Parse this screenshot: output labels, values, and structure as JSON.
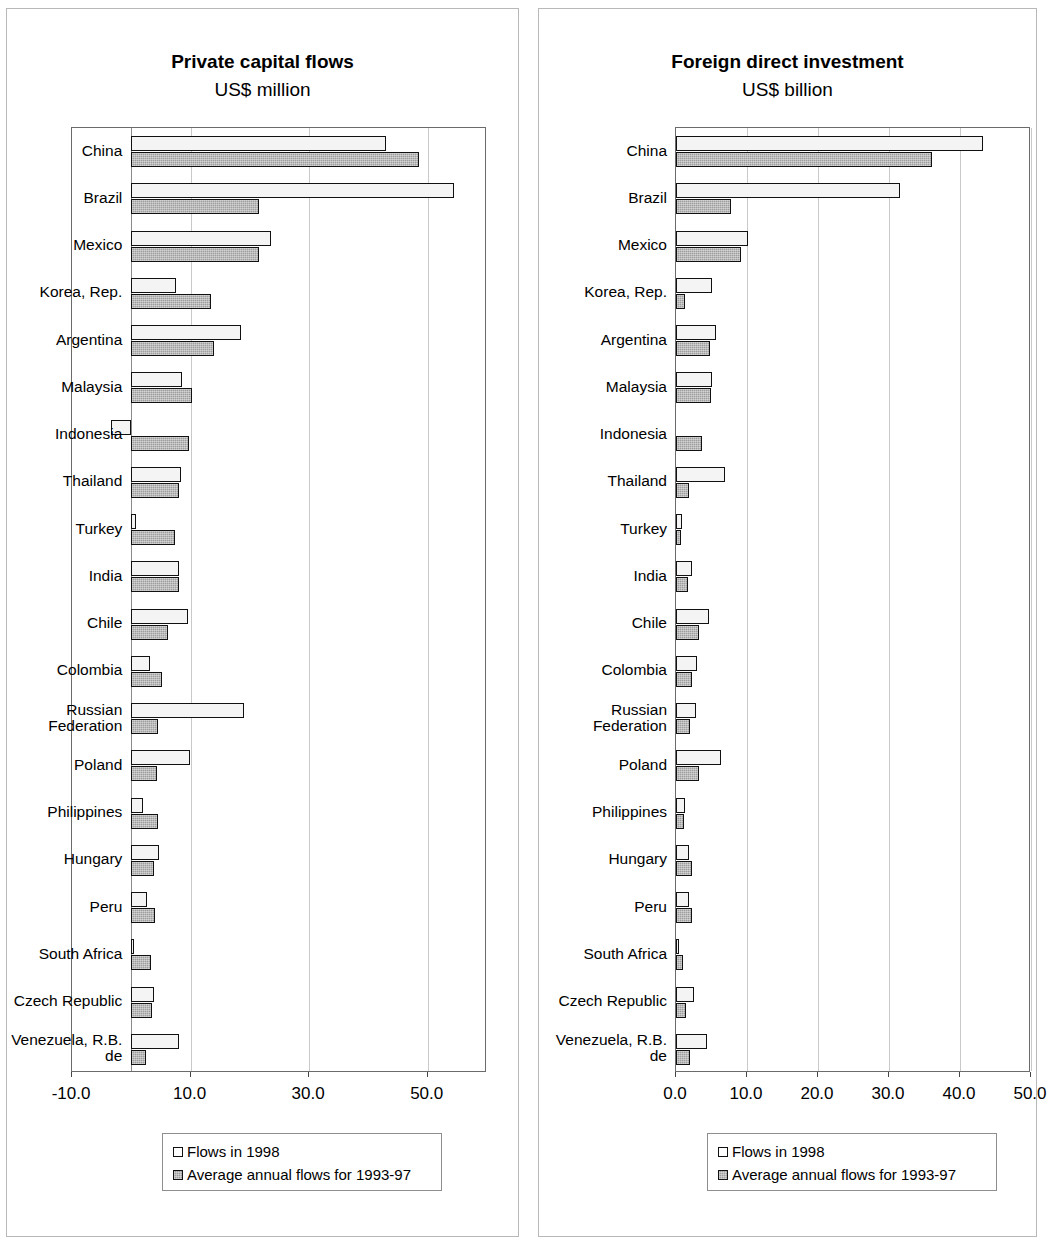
{
  "charts": [
    {
      "id": "private-capital-flows",
      "title": "Private capital flows",
      "subtitle": "US$ million",
      "legend": {
        "series1": "Flows in 1998",
        "series2": "Average annual flows for 1993-97"
      }
    },
    {
      "id": "foreign-direct-investment",
      "title": "Foreign direct investment",
      "subtitle": "US$ billion",
      "legend": {
        "series1": "Flows in 1998",
        "series2": "Average annual flows for 1993-97"
      }
    }
  ],
  "chart_data": [
    {
      "type": "bar",
      "orientation": "horizontal",
      "title": "Private capital flows",
      "subtitle": "US$ million",
      "xlabel": "",
      "ylabel": "",
      "xlim": [
        -10.0,
        60.0
      ],
      "ticks": [
        "-10.0",
        "10.0",
        "30.0",
        "50.0"
      ],
      "tick_values": [
        -10.0,
        10.0,
        30.0,
        50.0
      ],
      "grid": true,
      "legend_position": "below",
      "categories": [
        "China",
        "Brazil",
        "Mexico",
        "Korea, Rep.",
        "Argentina",
        "Malaysia",
        "Indonesia",
        "Thailand",
        "Turkey",
        "India",
        "Chile",
        "Colombia",
        "Russian\nFederation",
        "Poland",
        "Philippines",
        "Hungary",
        "Peru",
        "South Africa",
        "Czech Republic",
        "Venezuela, R.B.\nde"
      ],
      "series": [
        {
          "name": "Flows in 1998",
          "values": [
            43.0,
            54.5,
            23.5,
            7.5,
            18.5,
            8.5,
            -3.5,
            8.4,
            0.8,
            8.0,
            9.5,
            3.2,
            19.0,
            9.9,
            2.0,
            4.7,
            2.7,
            0.5,
            3.8,
            8.0
          ]
        },
        {
          "name": "Average annual flows for 1993-97",
          "values": [
            48.5,
            21.5,
            21.5,
            13.5,
            14.0,
            10.2,
            9.7,
            8.0,
            7.4,
            8.0,
            6.2,
            5.1,
            4.5,
            4.3,
            4.5,
            3.8,
            4.0,
            3.3,
            3.5,
            2.5
          ]
        }
      ]
    },
    {
      "type": "bar",
      "orientation": "horizontal",
      "title": "Foreign direct investment",
      "subtitle": "US$ billion",
      "xlabel": "",
      "ylabel": "",
      "xlim": [
        0.0,
        50.0
      ],
      "ticks": [
        "0.0",
        "10.0",
        "20.0",
        "30.0",
        "40.0",
        "50.0"
      ],
      "tick_values": [
        0.0,
        10.0,
        20.0,
        30.0,
        40.0,
        50.0
      ],
      "grid": true,
      "legend_position": "below",
      "categories": [
        "China",
        "Brazil",
        "Mexico",
        "Korea, Rep.",
        "Argentina",
        "Malaysia",
        "Indonesia",
        "Thailand",
        "Turkey",
        "India",
        "Chile",
        "Colombia",
        "Russian\nFederation",
        "Poland",
        "Philippines",
        "Hungary",
        "Peru",
        "South Africa",
        "Czech Republic",
        "Venezuela, R.B.\nde"
      ],
      "series": [
        {
          "name": "Flows in 1998",
          "values": [
            43.3,
            31.5,
            10.2,
            5.1,
            5.7,
            5.0,
            0.0,
            6.9,
            0.8,
            2.3,
            4.6,
            3.0,
            2.8,
            6.4,
            1.2,
            1.9,
            1.9,
            0.4,
            2.5,
            4.4
          ]
        },
        {
          "name": "Average annual flows for 1993-97",
          "values": [
            36.0,
            7.8,
            9.2,
            1.2,
            4.8,
            4.9,
            3.6,
            1.9,
            0.7,
            1.7,
            3.3,
            2.3,
            2.0,
            3.2,
            1.1,
            2.3,
            2.2,
            1.0,
            1.4,
            2.0
          ]
        }
      ]
    }
  ],
  "colors": {
    "series1_fill": "#f4f4f4",
    "series2_fill": "#9d9d9d",
    "bar_border": "#111111",
    "grid": "#c9c9c9",
    "axis": "#6b6b6b"
  }
}
